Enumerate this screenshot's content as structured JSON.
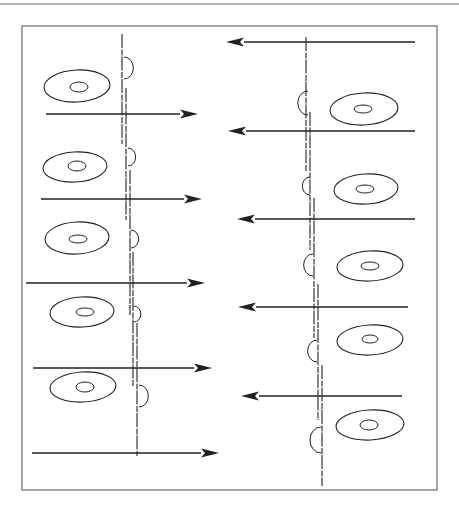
{
  "figure": {
    "ink_color": "#222222",
    "frame_color": "#888888",
    "top_rule": {
      "y": 4,
      "x1": 0,
      "x2": 459
    },
    "frame": {
      "x": 22,
      "y": 26,
      "w": 415,
      "h": 464
    }
  },
  "left_column": {
    "arrow_direction": "right",
    "arrows": [
      {
        "y": 114,
        "x1": 46,
        "x2": 198
      },
      {
        "y": 199,
        "x1": 41,
        "x2": 202
      },
      {
        "y": 283,
        "x1": 26,
        "x2": 205
      },
      {
        "y": 368,
        "x1": 33,
        "x2": 212
      },
      {
        "y": 453,
        "x1": 32,
        "x2": 219
      }
    ],
    "vertical_lines": [
      {
        "x": 122,
        "y1": 34,
        "y2": 144
      },
      {
        "x": 126,
        "y1": 88,
        "y2": 220
      },
      {
        "x": 130,
        "y1": 170,
        "y2": 315
      },
      {
        "x": 133,
        "y1": 252,
        "y2": 386
      },
      {
        "x": 137,
        "y1": 323,
        "y2": 456
      }
    ],
    "bumps": [
      {
        "x": 124,
        "y": 68,
        "r": 11
      },
      {
        "x": 128,
        "y": 157,
        "r": 9
      },
      {
        "x": 131,
        "y": 239,
        "r": 9
      },
      {
        "x": 134,
        "y": 314,
        "r": 8
      },
      {
        "x": 139,
        "y": 396,
        "r": 11
      }
    ],
    "cells": [
      {
        "cx": 77,
        "cy": 86,
        "rx": 33,
        "ry": 16,
        "nx": 79,
        "ny": 87,
        "nrx": 9,
        "nry": 5
      },
      {
        "cx": 75,
        "cy": 167,
        "rx": 32,
        "ry": 15,
        "nx": 77,
        "ny": 166,
        "nrx": 9,
        "nry": 5
      },
      {
        "cx": 77,
        "cy": 238,
        "rx": 32,
        "ry": 16,
        "nx": 78,
        "ny": 239,
        "nrx": 9,
        "nry": 4
      },
      {
        "cx": 82,
        "cy": 312,
        "rx": 32,
        "ry": 15,
        "nx": 85,
        "ny": 312,
        "nrx": 9,
        "nry": 4
      },
      {
        "cx": 83,
        "cy": 387,
        "rx": 33,
        "ry": 15,
        "nx": 85,
        "ny": 387,
        "nrx": 9,
        "nry": 5
      }
    ]
  },
  "right_column": {
    "arrow_direction": "left",
    "arrows": [
      {
        "y": 42,
        "x1": 226,
        "x2": 415
      },
      {
        "y": 131,
        "x1": 228,
        "x2": 415
      },
      {
        "y": 219,
        "x1": 237,
        "x2": 415
      },
      {
        "y": 307,
        "x1": 238,
        "x2": 408
      },
      {
        "y": 396,
        "x1": 241,
        "x2": 402
      }
    ],
    "vertical_lines": [
      {
        "x": 306,
        "y1": 37,
        "y2": 171
      },
      {
        "x": 310,
        "y1": 112,
        "y2": 250
      },
      {
        "x": 314,
        "y1": 198,
        "y2": 338
      },
      {
        "x": 318,
        "y1": 284,
        "y2": 420
      },
      {
        "x": 322,
        "y1": 365,
        "y2": 486
      }
    ],
    "bumps": [
      {
        "x": 308,
        "y": 103,
        "r": 12
      },
      {
        "x": 310,
        "y": 186,
        "r": 9
      },
      {
        "x": 313,
        "y": 265,
        "r": 11
      },
      {
        "x": 317,
        "y": 351,
        "r": 11
      },
      {
        "x": 321,
        "y": 440,
        "r": 13
      }
    ],
    "cells": [
      {
        "cx": 364,
        "cy": 109,
        "rx": 34,
        "ry": 16,
        "nx": 363,
        "ny": 109,
        "nrx": 9,
        "nry": 4
      },
      {
        "cx": 366,
        "cy": 189,
        "rx": 32,
        "ry": 15,
        "nx": 365,
        "ny": 189,
        "nrx": 9,
        "nry": 4
      },
      {
        "cx": 370,
        "cy": 266,
        "rx": 33,
        "ry": 15,
        "nx": 370,
        "ny": 266,
        "nrx": 9,
        "nry": 4
      },
      {
        "cx": 370,
        "cy": 340,
        "rx": 33,
        "ry": 15,
        "nx": 370,
        "ny": 339,
        "nrx": 8,
        "nry": 4
      },
      {
        "cx": 370,
        "cy": 425,
        "rx": 34,
        "ry": 15,
        "nx": 369,
        "ny": 425,
        "nrx": 9,
        "nry": 5
      }
    ]
  }
}
